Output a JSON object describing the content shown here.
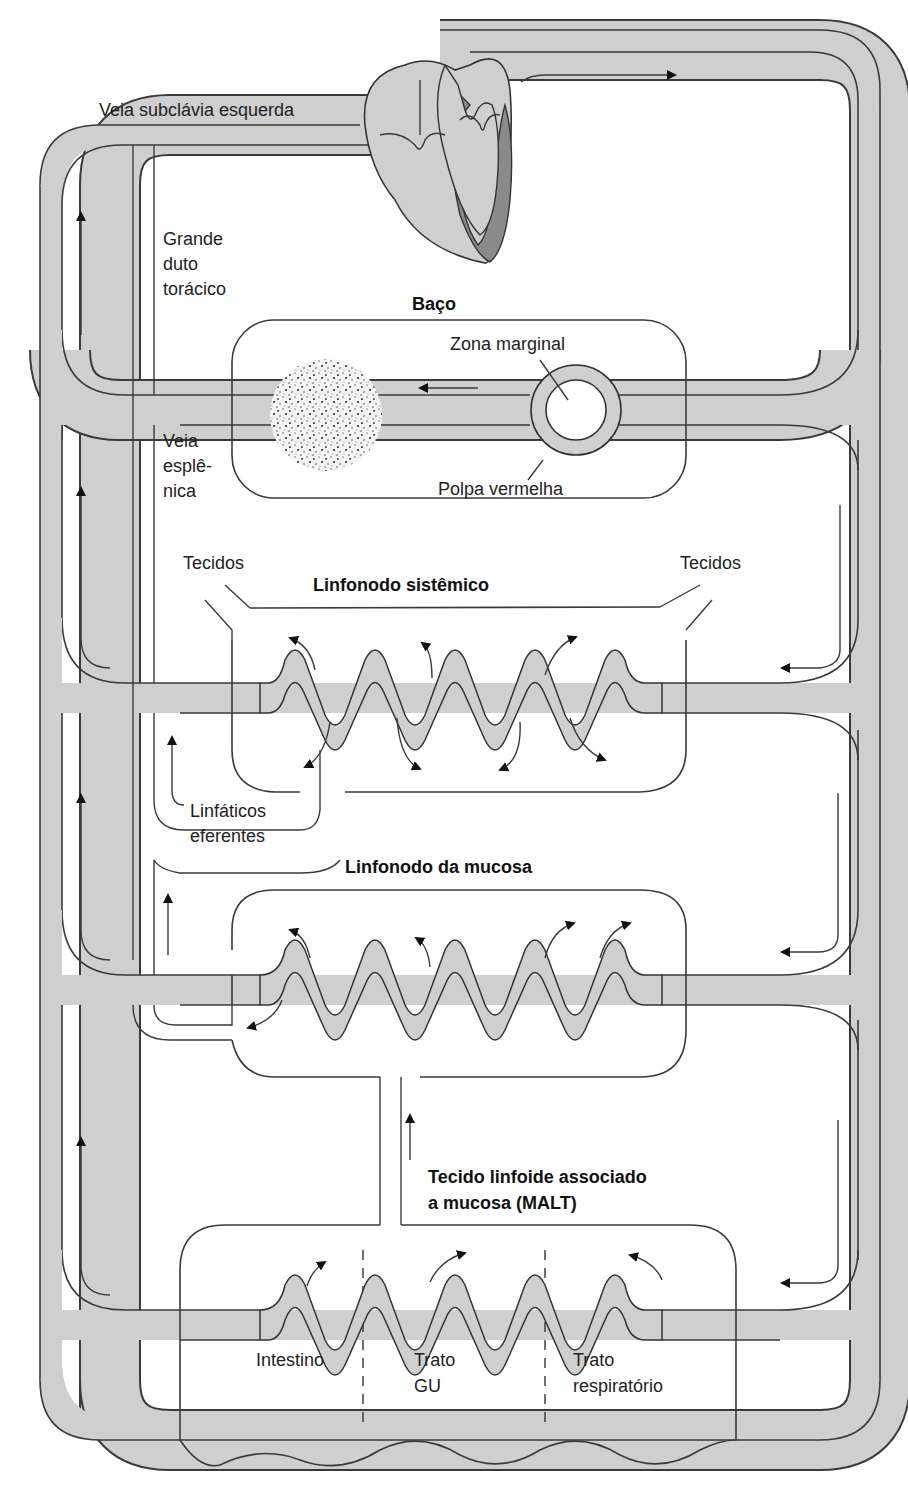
{
  "diagram": {
    "colors": {
      "vessel_fill": "#cfcfcf",
      "vessel_stroke": "#3a3a3a",
      "heart_dark": "#8a8a8a",
      "background": "#ffffff"
    },
    "labels": {
      "subclavian_vein": "Veia subclávia esquerda",
      "thoracic_duct_1": "Grande",
      "thoracic_duct_2": "duto",
      "thoracic_duct_3": "torácico",
      "spleen_title": "Baço",
      "marginal_zone": "Zona marginal",
      "red_pulp": "Polpa vermelha",
      "splenic_vein_1": "Veia",
      "splenic_vein_2": "esplê-",
      "splenic_vein_3": "nica",
      "tissues_left": "Tecidos",
      "tissues_right": "Tecidos",
      "systemic_node_title": "Linfonodo sistêmico",
      "efferent_1": "Linfáticos",
      "efferent_2": "eferentes",
      "mucosal_node_title": "Linfonodo da mucosa",
      "malt_1": "Tecido linfoide associado",
      "malt_2": "a mucosa (MALT)",
      "intestine": "Intestino",
      "gu_tract_1": "Trato",
      "gu_tract_2": "GU",
      "resp_tract_1": "Trato",
      "resp_tract_2": "respiratório"
    },
    "compartments": [
      {
        "name": "Baço",
        "type": "spleen"
      },
      {
        "name": "Linfonodo sistêmico",
        "type": "lymph-node"
      },
      {
        "name": "Linfonodo da mucosa",
        "type": "lymph-node"
      },
      {
        "name": "Tecido linfoide associado a mucosa (MALT)",
        "type": "malt",
        "regions": [
          "Intestino",
          "Trato GU",
          "Trato respiratório"
        ]
      }
    ]
  }
}
